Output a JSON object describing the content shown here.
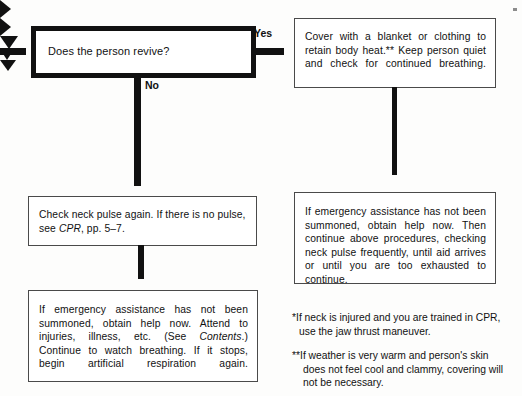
{
  "diagram": {
    "accent_color": "#111111",
    "background_color": "#fdfdfc"
  },
  "nodes": {
    "decision": {
      "name": "does-the-person-revive",
      "text": "Does the person revive?"
    },
    "cover": {
      "name": "cover-with-blanket",
      "text": "Cover with a blanket or clothing to retain body heat.** Keep person quiet and check for continued breathing."
    },
    "pulse": {
      "name": "check-neck-pulse",
      "text_before": "Check neck pulse again. If there is no pulse, see ",
      "italic": "CPR",
      "text_after": ", pp. 5–7."
    },
    "emergency_left": {
      "name": "emergency-assistance-left",
      "text_before": "If emergency assistance has not been summoned, obtain help now. Attend to injuries, illness, etc. (See ",
      "italic": "Contents",
      "text_after": ".) Continue to watch breathing. If it stops, begin artificial respiration again."
    },
    "emergency_right": {
      "name": "emergency-assistance-right",
      "text": "If emergency assistance has not been summoned, obtain help now. Then continue above procedures, checking neck pulse frequently, until aid arrives or until you are too exhausted to continue."
    }
  },
  "edges": {
    "yes_label": "Yes",
    "no_label": "No"
  },
  "footnotes": [
    {
      "marker": "*",
      "text": "If neck is injured and you are trained in CPR, use the jaw thrust maneuver."
    },
    {
      "marker": "**",
      "text": "If weather is very warm and person's skin does not feel cool and clammy, covering will not be necessary."
    }
  ]
}
